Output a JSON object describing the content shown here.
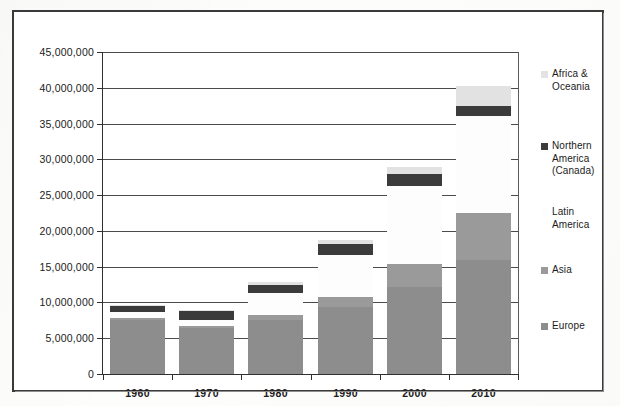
{
  "chart_data": {
    "type": "bar",
    "stacked": true,
    "title": "",
    "subtitle": "",
    "xlabel": "",
    "ylabel": "",
    "categories": [
      "1960",
      "1970",
      "1980",
      "1990",
      "2000",
      "2010"
    ],
    "ylim": [
      0,
      45000000
    ],
    "ytick_step": 5000000,
    "ytick_labels": [
      "45,000,000",
      "40,000,000",
      "35,000,000",
      "30,000,000",
      "25,000,000",
      "20,000,000",
      "15,000,000",
      "10,000,000",
      "5,000,000",
      "0"
    ],
    "ytick_values": [
      45000000,
      40000000,
      35000000,
      30000000,
      25000000,
      20000000,
      15000000,
      10000000,
      5000000,
      0
    ],
    "grid": true,
    "grid_axis": "y",
    "legend_position": "right",
    "series": [
      {
        "name": "Europe",
        "color": "#8d8d8d",
        "values": [
          7600000,
          6400000,
          7500000,
          9300000,
          12200000,
          16000000
        ]
      },
      {
        "name": "Asia",
        "color": "#9a9a9a",
        "values": [
          200000,
          300000,
          700000,
          1500000,
          3200000,
          6500000
        ]
      },
      {
        "name": "Latin America",
        "color": "#fdfdfd",
        "values": [
          800000,
          900000,
          3100000,
          5800000,
          10900000,
          13500000
        ]
      },
      {
        "name": "Northern America (Canada)",
        "color": "#3b3b3b",
        "values": [
          900000,
          1200000,
          1200000,
          1600000,
          1700000,
          1500000
        ]
      },
      {
        "name": "Africa & Oceania",
        "color": "#e2e2e2",
        "values": [
          100000,
          100000,
          300000,
          500000,
          900000,
          2700000
        ]
      }
    ],
    "series_totals": [
      9600000,
      8900000,
      12800000,
      18700000,
      28900000,
      40200000
    ]
  },
  "legend": {
    "items": [
      {
        "label": "Africa & Oceania",
        "color": "#e2e2e2"
      },
      {
        "label": "Northern America (Canada)",
        "color": "#3b3b3b"
      },
      {
        "label": "Latin America",
        "color": "#fdfdfd"
      },
      {
        "label": "Asia",
        "color": "#9a9a9a"
      },
      {
        "label": "Europe",
        "color": "#8d8d8d"
      }
    ]
  },
  "axis": {
    "y_max_label": "45,000,000",
    "y_min_label": "0"
  }
}
